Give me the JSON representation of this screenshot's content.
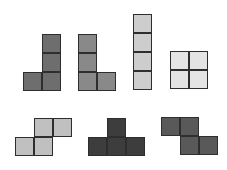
{
  "cell_size": 19,
  "pieces": [
    {
      "name": "J",
      "color": "#6e6e6e",
      "x": 23,
      "y": 34,
      "cells": [
        [
          1,
          0
        ],
        [
          1,
          1
        ],
        [
          0,
          2
        ],
        [
          1,
          2
        ]
      ]
    },
    {
      "name": "L",
      "color": "#898989",
      "x": 78,
      "y": 34,
      "cells": [
        [
          0,
          0
        ],
        [
          0,
          1
        ],
        [
          0,
          2
        ],
        [
          1,
          2
        ]
      ]
    },
    {
      "name": "I",
      "color": "#cdcdcd",
      "x": 133,
      "y": 14,
      "cells": [
        [
          0,
          0
        ],
        [
          0,
          1
        ],
        [
          0,
          2
        ],
        [
          0,
          3
        ]
      ]
    },
    {
      "name": "O",
      "color": "#e4e4e4",
      "x": 170,
      "y": 51,
      "cells": [
        [
          0,
          0
        ],
        [
          1,
          0
        ],
        [
          0,
          1
        ],
        [
          1,
          1
        ]
      ]
    },
    {
      "name": "S",
      "color": "#c0c0c0",
      "x": 15,
      "y": 118,
      "cells": [
        [
          1,
          0
        ],
        [
          2,
          0
        ],
        [
          0,
          1
        ],
        [
          1,
          1
        ]
      ]
    },
    {
      "name": "T",
      "color": "#3d3d3d",
      "x": 88,
      "y": 118,
      "cells": [
        [
          1,
          0
        ],
        [
          0,
          1
        ],
        [
          1,
          1
        ],
        [
          2,
          1
        ]
      ]
    },
    {
      "name": "Z",
      "color": "#595959",
      "x": 161,
      "y": 117,
      "cells": [
        [
          0,
          0
        ],
        [
          1,
          0
        ],
        [
          1,
          1
        ],
        [
          2,
          1
        ]
      ]
    }
  ]
}
